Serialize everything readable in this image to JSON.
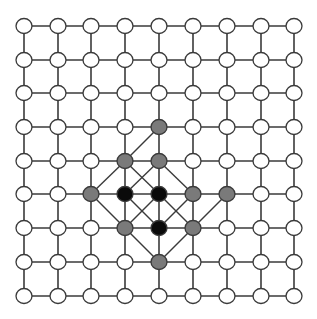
{
  "grid": {
    "cols": 9,
    "rows": 9,
    "x": [
      24,
      58,
      91,
      125,
      159,
      193,
      227,
      261,
      294
    ],
    "y": [
      26,
      60,
      93,
      127,
      161,
      194,
      228,
      262,
      296
    ],
    "node_rx": 8,
    "node_ry": 7.5
  },
  "colors": {
    "empty": "#ffffff",
    "gray": "#7a7a7a",
    "black": "#0a0a0a",
    "line": "#3a3a3a"
  },
  "colored_nodes": [
    {
      "c": 4,
      "r": 3,
      "state": "gray"
    },
    {
      "c": 3,
      "r": 4,
      "state": "gray"
    },
    {
      "c": 4,
      "r": 4,
      "state": "gray"
    },
    {
      "c": 2,
      "r": 5,
      "state": "gray"
    },
    {
      "c": 3,
      "r": 5,
      "state": "black"
    },
    {
      "c": 4,
      "r": 5,
      "state": "black"
    },
    {
      "c": 5,
      "r": 5,
      "state": "gray"
    },
    {
      "c": 6,
      "r": 5,
      "state": "gray"
    },
    {
      "c": 3,
      "r": 6,
      "state": "gray"
    },
    {
      "c": 4,
      "r": 6,
      "state": "black"
    },
    {
      "c": 5,
      "r": 6,
      "state": "gray"
    },
    {
      "c": 4,
      "r": 7,
      "state": "gray"
    }
  ],
  "diagonal_edges": [
    [
      [
        4,
        3
      ],
      [
        3,
        4
      ]
    ],
    [
      [
        3,
        4
      ],
      [
        2,
        5
      ]
    ],
    [
      [
        3,
        4
      ],
      [
        4,
        5
      ]
    ],
    [
      [
        4,
        4
      ],
      [
        3,
        5
      ]
    ],
    [
      [
        4,
        4
      ],
      [
        5,
        5
      ]
    ],
    [
      [
        2,
        5
      ],
      [
        3,
        6
      ]
    ],
    [
      [
        3,
        6
      ],
      [
        4,
        7
      ]
    ],
    [
      [
        3,
        5
      ],
      [
        4,
        6
      ]
    ],
    [
      [
        4,
        5
      ],
      [
        3,
        6
      ]
    ],
    [
      [
        4,
        5
      ],
      [
        5,
        6
      ]
    ],
    [
      [
        5,
        5
      ],
      [
        4,
        6
      ]
    ],
    [
      [
        6,
        5
      ],
      [
        5,
        6
      ]
    ],
    [
      [
        5,
        6
      ],
      [
        4,
        7
      ]
    ]
  ]
}
